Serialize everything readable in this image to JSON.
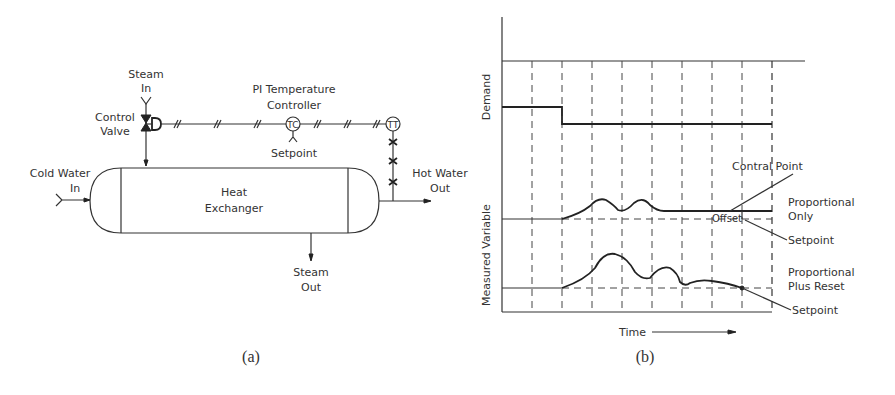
{
  "diagram_a": {
    "caption": "(a)",
    "steam_in": [
      "Steam",
      "In"
    ],
    "control_valve": [
      "Control",
      "Valve"
    ],
    "controller": [
      "PI Temperature",
      "Controller"
    ],
    "controller_symbol": "TC",
    "transmitter_symbol": "TT",
    "setpoint": "Setpoint",
    "cold_water_in": [
      "Cold Water",
      "In"
    ],
    "heat_exchanger": [
      "Heat",
      "Exchanger"
    ],
    "hot_water_out": [
      "Hot Water",
      "Out"
    ],
    "steam_out": [
      "Steam",
      "Out"
    ]
  },
  "diagram_b": {
    "caption": "(b)",
    "y_label_top": "Demand",
    "y_label_bottom": "Measured Variable",
    "x_label": "Time",
    "annotations": {
      "control_point": "Contral Point",
      "offset": "Offset",
      "proportional_only": [
        "Proportional",
        "Only"
      ],
      "setpoint_1": "Setpoint",
      "proportional_plus_reset": [
        "Proportional",
        "Plus Reset"
      ],
      "setpoint_2": "Setpoint"
    }
  },
  "chart_data": {
    "type": "line",
    "title": "",
    "xlabel": "Time",
    "x_intervals": 9,
    "series": [
      {
        "name": "Demand",
        "step_at_interval": 2,
        "level_before": 1.0,
        "level_after": 0.6
      },
      {
        "name": "Proportional Only",
        "response": "two overshoot humps, settles above setpoint",
        "final_state": "offset from setpoint"
      },
      {
        "name": "Proportional Plus Reset",
        "response": "larger oscillation, decays",
        "final_state": "returns to setpoint"
      }
    ]
  }
}
